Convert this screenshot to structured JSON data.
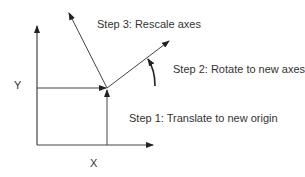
{
  "diagram": {
    "axis_labels": {
      "x": "X",
      "y": "Y"
    },
    "steps": [
      {
        "label": "Step 1: Translate to new origin"
      },
      {
        "label": "Step 2: Rotate to new axes"
      },
      {
        "label": "Step 3: Rescale axes"
      }
    ],
    "colors": {
      "line": "#333333",
      "background": "#ffffff"
    }
  }
}
